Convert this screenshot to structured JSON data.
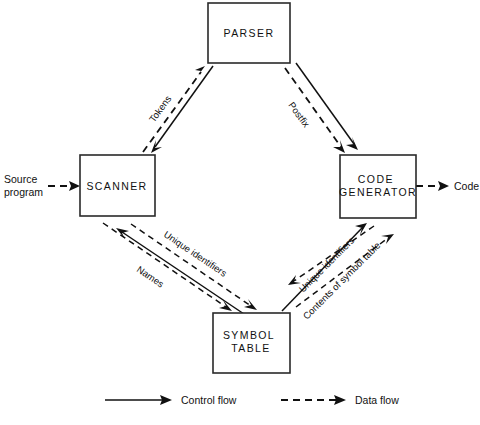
{
  "diagram": {
    "nodes": [
      {
        "id": "parser",
        "label_lines": [
          "PARSER"
        ]
      },
      {
        "id": "scanner",
        "label_lines": [
          "SCANNER"
        ]
      },
      {
        "id": "codegen",
        "label_lines": [
          "CODE",
          "GENERATOR"
        ]
      },
      {
        "id": "symtab",
        "label_lines": [
          "SYMBOL",
          "TABLE"
        ]
      }
    ],
    "io": {
      "input_lines": [
        "Source",
        "program"
      ],
      "output_label": "Code"
    },
    "edge_labels": {
      "tokens": "Tokens",
      "postfix": "Postfix",
      "names": "Names",
      "unique_identifiers_left": "Unique identifiers",
      "unique_identifiers_right": "Unique identifiers",
      "contents_of_symbol_table": "Contents of symbol table"
    },
    "legend": {
      "control_flow": "Control flow",
      "data_flow": "Data flow"
    },
    "colors": {
      "ink": "#111111",
      "box_stroke": "#2a2a2a",
      "background": "#ffffff"
    }
  }
}
